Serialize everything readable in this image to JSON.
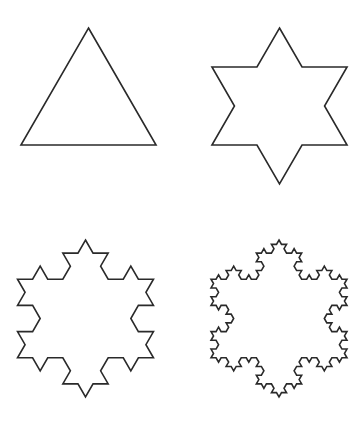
{
  "diagram": {
    "background": "#ffffff",
    "stroke_color": "#2a2a2a",
    "stroke_width": 1.6,
    "panels": [
      {
        "name": "koch-iteration-0",
        "iteration": 0,
        "cx": 88.5,
        "cy": 106,
        "top_y": 28,
        "bottom_y": 145
      },
      {
        "name": "koch-iteration-1",
        "iteration": 1,
        "cx": 279.5,
        "cy": 106,
        "top_y": 28,
        "bottom_y": 184
      },
      {
        "name": "koch-iteration-2",
        "iteration": 2,
        "cx": 85.5,
        "cy": 318.5,
        "top_y": 240,
        "bottom_y": 397
      },
      {
        "name": "koch-iteration-3",
        "iteration": 3,
        "cx": 279,
        "cy": 318.5,
        "top_y": 240,
        "bottom_y": 397
      }
    ]
  }
}
